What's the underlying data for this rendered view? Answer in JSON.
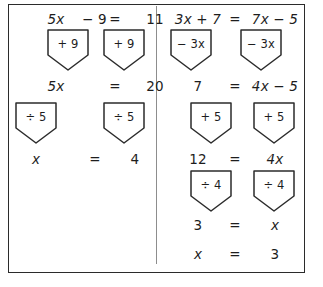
{
  "worksheet": {
    "title": "Solving linear equations with balance-operation flowcharts",
    "border_color": "#2b2b2b",
    "divider_color": "#8d8d8d",
    "text_color": "#1d1d1d"
  },
  "columns": [
    {
      "name": "left-example",
      "problem": "5x - 9 = 11",
      "rows": [
        {
          "id": "l-row-1",
          "left": "5x",
          "left_op": "− 9",
          "equals": "=",
          "right": "11"
        },
        {
          "id": "l-row-2",
          "left": "5x",
          "equals": "=",
          "right": "20"
        },
        {
          "id": "l-row-3",
          "left": "x",
          "equals": "=",
          "right": "4"
        }
      ],
      "operations": [
        {
          "id": "l-op-1-left",
          "label": "+ 9",
          "side": "left"
        },
        {
          "id": "l-op-1-right",
          "label": "+ 9",
          "side": "right"
        },
        {
          "id": "l-op-2-left",
          "label": "÷ 5",
          "side": "left"
        },
        {
          "id": "l-op-2-right",
          "label": "÷ 5",
          "side": "right"
        }
      ]
    },
    {
      "name": "right-example",
      "problem": "3x + 7 = 7x - 5",
      "rows": [
        {
          "id": "r-row-1",
          "left": "3x + 7",
          "equals": "=",
          "right": "7x − 5"
        },
        {
          "id": "r-row-2",
          "left": "7",
          "equals": "=",
          "right": "4x − 5"
        },
        {
          "id": "r-row-3",
          "left": "12",
          "equals": "=",
          "right": "4x"
        },
        {
          "id": "r-row-4",
          "left": "3",
          "equals": "=",
          "right": "x"
        },
        {
          "id": "r-row-5",
          "left": "x",
          "equals": "=",
          "right": "3"
        }
      ],
      "operations": [
        {
          "id": "r-op-1-left",
          "label": "− 3x",
          "side": "left"
        },
        {
          "id": "r-op-1-right",
          "label": "− 3x",
          "side": "right"
        },
        {
          "id": "r-op-2-left",
          "label": "+ 5",
          "side": "left"
        },
        {
          "id": "r-op-2-right",
          "label": "+ 5",
          "side": "right"
        },
        {
          "id": "r-op-3-left",
          "label": "÷ 4",
          "side": "left"
        },
        {
          "id": "r-op-3-right",
          "label": "÷ 4",
          "side": "right"
        }
      ]
    }
  ],
  "left": {
    "row1": {
      "a": "5x",
      "b": "− 9",
      "eq": "=",
      "c": "11"
    },
    "plate1a": "+ 9",
    "plate1b": "+ 9",
    "row2": {
      "a": "5x",
      "eq": "=",
      "c": "20"
    },
    "plate2a": "÷ 5",
    "plate2b": "÷ 5",
    "row3": {
      "a": "x",
      "eq": "=",
      "c": "4"
    }
  },
  "right": {
    "row1": {
      "a": "3x + 7",
      "eq": "=",
      "c": "7x − 5"
    },
    "plate1a": "− 3x",
    "plate1b": "− 3x",
    "row2": {
      "a": "7",
      "eq": "=",
      "c": "4x − 5"
    },
    "plate2a": "+ 5",
    "plate2b": "+ 5",
    "row3": {
      "a": "12",
      "eq": "=",
      "c": "4x"
    },
    "plate3a": "÷ 4",
    "plate3b": "÷ 4",
    "row4": {
      "a": "3",
      "eq": "=",
      "c": "x"
    },
    "row5": {
      "a": "x",
      "eq": "=",
      "c": "3"
    }
  }
}
